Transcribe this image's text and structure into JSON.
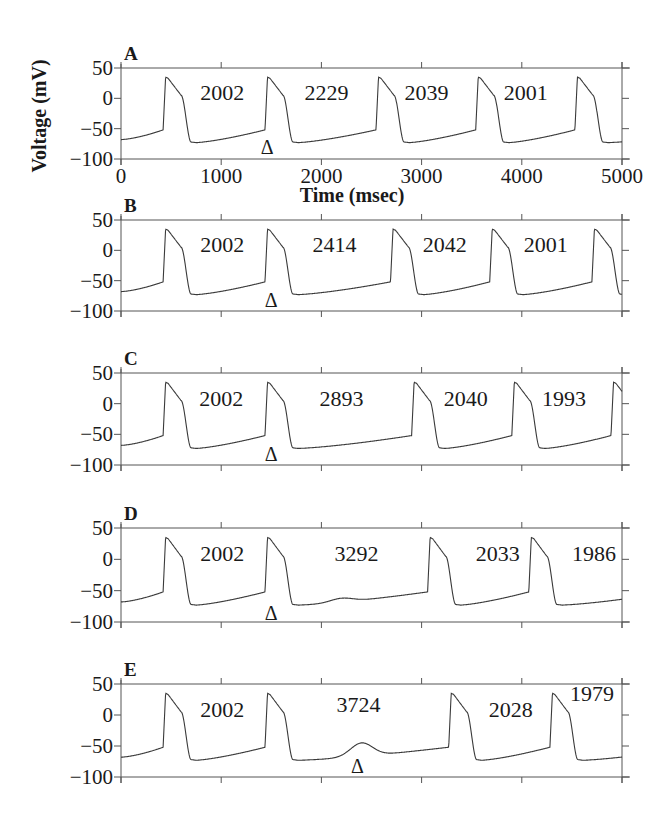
{
  "chart_data": {
    "type": "line",
    "title": "",
    "xlabel": "Time (msec)",
    "ylabel": "Voltage (mV)",
    "xlim": [
      0,
      5000
    ],
    "ylim": [
      -100,
      50
    ],
    "x_ticks": [
      0,
      1000,
      2000,
      3000,
      4000,
      5000
    ],
    "y_ticks": [
      50,
      0,
      -50,
      -100
    ],
    "y_tick_labels": [
      "50",
      "0",
      "−50",
      "−100"
    ],
    "x_tick_labels": [
      "0",
      "1000",
      "2000",
      "3000",
      "4000",
      "5000"
    ],
    "grid": false,
    "legend": null,
    "stimulus_marker": "Δ",
    "panels": [
      {
        "label": "A",
        "upstroke_times_ms": [
          420,
          1437,
          2545,
          3540,
          4530
        ],
        "subthreshold_bump": null,
        "interval_labels": [
          {
            "text": "2002",
            "x_ms": 1010,
            "y_mV": 10
          },
          {
            "text": "2229",
            "x_ms": 2050,
            "y_mV": 10
          },
          {
            "text": "2039",
            "x_ms": 3050,
            "y_mV": 10
          },
          {
            "text": "2001",
            "x_ms": 4040,
            "y_mV": 10
          }
        ],
        "marker": {
          "x_ms": 1460,
          "y_mV": -78
        }
      },
      {
        "label": "B",
        "upstroke_times_ms": [
          420,
          1437,
          2690,
          3680,
          4700
        ],
        "subthreshold_bump": null,
        "interval_labels": [
          {
            "text": "2002",
            "x_ms": 1010,
            "y_mV": 10
          },
          {
            "text": "2414",
            "x_ms": 2130,
            "y_mV": 10
          },
          {
            "text": "2042",
            "x_ms": 3230,
            "y_mV": 10
          },
          {
            "text": "2001",
            "x_ms": 4240,
            "y_mV": 10
          }
        ],
        "marker": {
          "x_ms": 1500,
          "y_mV": -80
        }
      },
      {
        "label": "C",
        "upstroke_times_ms": [
          420,
          1437,
          2900,
          3900,
          4890
        ],
        "subthreshold_bump": null,
        "interval_labels": [
          {
            "text": "2002",
            "x_ms": 1000,
            "y_mV": 10
          },
          {
            "text": "2893",
            "x_ms": 2200,
            "y_mV": 10
          },
          {
            "text": "2040",
            "x_ms": 3440,
            "y_mV": 10
          },
          {
            "text": "1993",
            "x_ms": 4420,
            "y_mV": 10
          }
        ],
        "marker": {
          "x_ms": 1500,
          "y_mV": -80
        }
      },
      {
        "label": "D",
        "upstroke_times_ms": [
          420,
          1437,
          3060,
          4070
        ],
        "subthreshold_bump": {
          "x_ms": 2200,
          "peak_mV": -62
        },
        "interval_labels": [
          {
            "text": "2002",
            "x_ms": 1010,
            "y_mV": 10
          },
          {
            "text": "3292",
            "x_ms": 2350,
            "y_mV": 10
          },
          {
            "text": "2033",
            "x_ms": 3760,
            "y_mV": 10
          },
          {
            "text": "1986",
            "x_ms": 4720,
            "y_mV": 10
          }
        ],
        "marker": {
          "x_ms": 1500,
          "y_mV": -84
        }
      },
      {
        "label": "E",
        "upstroke_times_ms": [
          420,
          1437,
          3270,
          4280
        ],
        "subthreshold_bump": {
          "x_ms": 2400,
          "peak_mV": -45
        },
        "interval_labels": [
          {
            "text": "2002",
            "x_ms": 1010,
            "y_mV": 10
          },
          {
            "text": "3724",
            "x_ms": 2370,
            "y_mV": 18
          },
          {
            "text": "2028",
            "x_ms": 3890,
            "y_mV": 10
          },
          {
            "text": "1979",
            "x_ms": 4700,
            "y_mV": 35
          }
        ],
        "marker": {
          "x_ms": 2360,
          "y_mV": -80
        }
      }
    ]
  },
  "figure": {
    "ylabel": "Voltage (mV)",
    "xlabel": "Time (msec)",
    "panel_labels": [
      "A",
      "B",
      "C",
      "D",
      "E"
    ],
    "line_color": "#3a3a3a",
    "axis_color": "#555555",
    "text_color": "#1a1a1a"
  }
}
